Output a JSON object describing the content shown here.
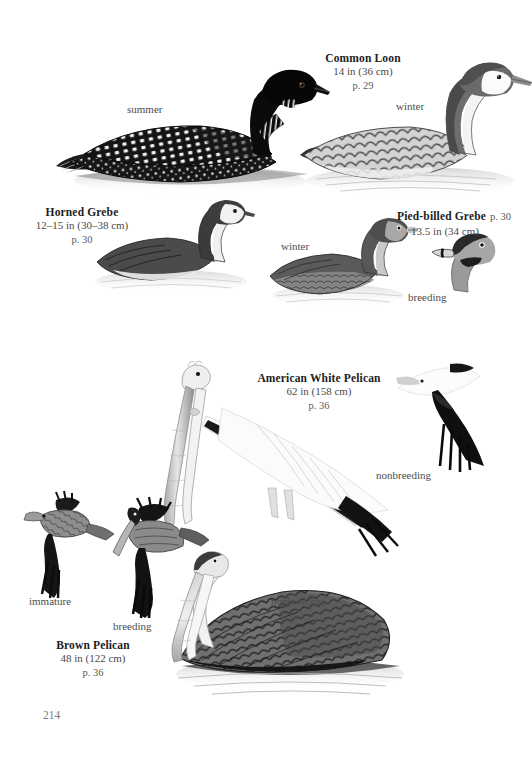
{
  "page": {
    "folio": "214",
    "background_color": "#ffffff",
    "ink_color": "#1d1d1d"
  },
  "plate_top": {
    "species": [
      {
        "name": "Common Loon",
        "size": "14 in (36 cm)",
        "page_ref": "p. 29"
      },
      {
        "name": "Horned Grebe",
        "size": "12–15 in (30–38 cm)",
        "page_ref": "p. 30"
      },
      {
        "name": "Pied-billed Grebe",
        "size": "13.5 in (34 cm)",
        "page_ref": "p. 30"
      }
    ],
    "annotations": [
      {
        "text": "summer"
      },
      {
        "text": "winter"
      },
      {
        "text": "winter"
      },
      {
        "text": "breeding"
      }
    ]
  },
  "plate_bottom": {
    "species": [
      {
        "name": "American White Pelican",
        "size": "62 in (158 cm)",
        "page_ref": "p. 36"
      },
      {
        "name": "Brown Pelican",
        "size": "48 in (122 cm)",
        "page_ref": "p. 36"
      }
    ],
    "annotations": [
      {
        "text": "nonbreeding"
      },
      {
        "text": "immature"
      },
      {
        "text": "breeding"
      },
      {
        "text": "nonbreeding"
      }
    ]
  }
}
